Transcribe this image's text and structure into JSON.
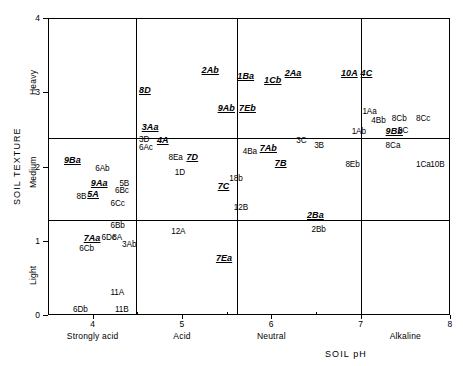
{
  "chart_data": {
    "type": "scatter",
    "title": "",
    "xlabel": "SOIL pH",
    "ylabel": "SOIL TEXTURE",
    "xlim": [
      3.5,
      8
    ],
    "ylim": [
      0,
      4
    ],
    "grid": true,
    "legend": null,
    "x_ticks": [
      4,
      5,
      6,
      7,
      8
    ],
    "x_tick_labels": [
      "4",
      "5",
      "6",
      "7",
      "8"
    ],
    "x_categories": [
      {
        "label": "Strongly acid",
        "center": 4.0
      },
      {
        "label": "Acid",
        "center": 5.0
      },
      {
        "label": "Neutral",
        "center": 6.0
      },
      {
        "label": "Alkaline",
        "center": 7.5
      }
    ],
    "y_ticks": [
      0,
      1,
      2,
      3,
      4
    ],
    "y_tick_labels": [
      "0",
      "1",
      "2",
      "3",
      "4"
    ],
    "y_categories": [
      {
        "label": "Light",
        "center": 0.65
      },
      {
        "label": "Medium",
        "center": 1.95
      },
      {
        "label": "Heavy",
        "center": 3.2
      }
    ],
    "x_gridlines": [
      4.45,
      5.6,
      7.0
    ],
    "y_gridlines": [
      1.4,
      2.5
    ],
    "points": [
      {
        "label": "8D",
        "x": 4.62,
        "y": 3.02,
        "emphasis": true
      },
      {
        "label": "2Ab",
        "x": 5.32,
        "y": 3.28,
        "emphasis": true
      },
      {
        "label": "1Ba",
        "x": 5.72,
        "y": 3.21,
        "emphasis": true
      },
      {
        "label": "1Cb",
        "x": 6.02,
        "y": 3.15,
        "emphasis": true
      },
      {
        "label": "2Aa",
        "x": 6.25,
        "y": 3.24,
        "emphasis": true
      },
      {
        "label": "10A",
        "x": 6.88,
        "y": 3.24,
        "emphasis": true
      },
      {
        "label": "4C",
        "x": 7.1,
        "y": 3.24,
        "emphasis": true
      },
      {
        "label": "9Ab",
        "x": 5.5,
        "y": 2.77,
        "emphasis": true
      },
      {
        "label": "7Eb",
        "x": 5.74,
        "y": 2.77,
        "emphasis": true
      },
      {
        "label": "1Aa",
        "x": 7.12,
        "y": 2.72,
        "emphasis": false
      },
      {
        "label": "4Bb",
        "x": 7.22,
        "y": 2.6,
        "emphasis": false
      },
      {
        "label": "8Cb",
        "x": 7.45,
        "y": 2.62,
        "emphasis": false
      },
      {
        "label": "8Cc",
        "x": 7.72,
        "y": 2.62,
        "emphasis": false
      },
      {
        "label": "3Aa",
        "x": 4.65,
        "y": 2.52,
        "emphasis": true
      },
      {
        "label": "1Ab",
        "x": 7.0,
        "y": 2.45,
        "emphasis": false
      },
      {
        "label": "9Bb",
        "x": 7.38,
        "y": 2.47,
        "emphasis": true
      },
      {
        "label": "2C",
        "x": 7.52,
        "y": 2.46,
        "emphasis": false
      },
      {
        "label": "3D",
        "x": 4.62,
        "y": 2.34,
        "emphasis": false
      },
      {
        "label": "4A",
        "x": 4.82,
        "y": 2.35,
        "emphasis": true
      },
      {
        "label": "6Ac",
        "x": 4.62,
        "y": 2.24,
        "emphasis": false
      },
      {
        "label": "4Ba",
        "x": 5.78,
        "y": 2.18,
        "emphasis": false
      },
      {
        "label": "7Ab",
        "x": 5.97,
        "y": 2.24,
        "emphasis": true
      },
      {
        "label": "3C",
        "x": 6.38,
        "y": 2.33,
        "emphasis": false
      },
      {
        "label": "3B",
        "x": 6.58,
        "y": 2.26,
        "emphasis": false
      },
      {
        "label": "8Ca",
        "x": 7.38,
        "y": 2.26,
        "emphasis": false
      },
      {
        "label": "9Ba",
        "x": 3.78,
        "y": 2.07,
        "emphasis": true
      },
      {
        "label": "8Ea",
        "x": 4.95,
        "y": 2.1,
        "emphasis": false
      },
      {
        "label": "7D",
        "x": 5.15,
        "y": 2.12,
        "emphasis": true
      },
      {
        "label": "7B",
        "x": 6.14,
        "y": 2.03,
        "emphasis": true
      },
      {
        "label": "8Eb",
        "x": 6.93,
        "y": 2.01,
        "emphasis": false
      },
      {
        "label": "1Ca",
        "x": 7.72,
        "y": 2.01,
        "emphasis": false
      },
      {
        "label": "10B",
        "x": 7.88,
        "y": 2.01,
        "emphasis": false
      },
      {
        "label": "6Ab",
        "x": 4.13,
        "y": 1.95,
        "emphasis": false
      },
      {
        "label": "1D",
        "x": 5.02,
        "y": 1.9,
        "emphasis": false
      },
      {
        "label": "9Aa",
        "x": 4.08,
        "y": 1.76,
        "emphasis": true
      },
      {
        "label": "5B",
        "x": 4.4,
        "y": 1.75,
        "emphasis": false
      },
      {
        "label": "18b",
        "x": 5.63,
        "y": 1.82,
        "emphasis": false
      },
      {
        "label": "7C",
        "x": 5.5,
        "y": 1.72,
        "emphasis": true
      },
      {
        "label": "5A",
        "x": 4.04,
        "y": 1.62,
        "emphasis": true
      },
      {
        "label": "6Bc",
        "x": 4.35,
        "y": 1.66,
        "emphasis": false
      },
      {
        "label": "8B",
        "x": 3.92,
        "y": 1.58,
        "emphasis": false
      },
      {
        "label": "6Cc",
        "x": 4.3,
        "y": 1.48,
        "emphasis": false
      },
      {
        "label": "12B",
        "x": 5.68,
        "y": 1.43,
        "emphasis": false
      },
      {
        "label": "2Ba",
        "x": 6.5,
        "y": 1.33,
        "emphasis": true
      },
      {
        "label": "6Bb",
        "x": 4.3,
        "y": 1.19,
        "emphasis": false
      },
      {
        "label": "12A",
        "x": 4.98,
        "y": 1.1,
        "emphasis": false
      },
      {
        "label": "2Bb",
        "x": 6.55,
        "y": 1.13,
        "emphasis": false
      },
      {
        "label": "7Aa",
        "x": 4.0,
        "y": 1.03,
        "emphasis": true
      },
      {
        "label": "6Dc",
        "x": 4.2,
        "y": 1.02,
        "emphasis": false
      },
      {
        "label": "8A",
        "x": 4.32,
        "y": 1.02,
        "emphasis": false
      },
      {
        "label": "3Ab",
        "x": 4.43,
        "y": 0.93,
        "emphasis": false
      },
      {
        "label": "6Cb",
        "x": 3.95,
        "y": 0.88,
        "emphasis": false
      },
      {
        "label": "7Ea",
        "x": 5.48,
        "y": 0.76,
        "emphasis": true
      },
      {
        "label": "11A",
        "x": 4.3,
        "y": 0.28,
        "emphasis": false
      },
      {
        "label": "6Db",
        "x": 3.88,
        "y": 0.06,
        "emphasis": false
      },
      {
        "label": "11B",
        "x": 4.35,
        "y": 0.05,
        "emphasis": false
      }
    ]
  }
}
